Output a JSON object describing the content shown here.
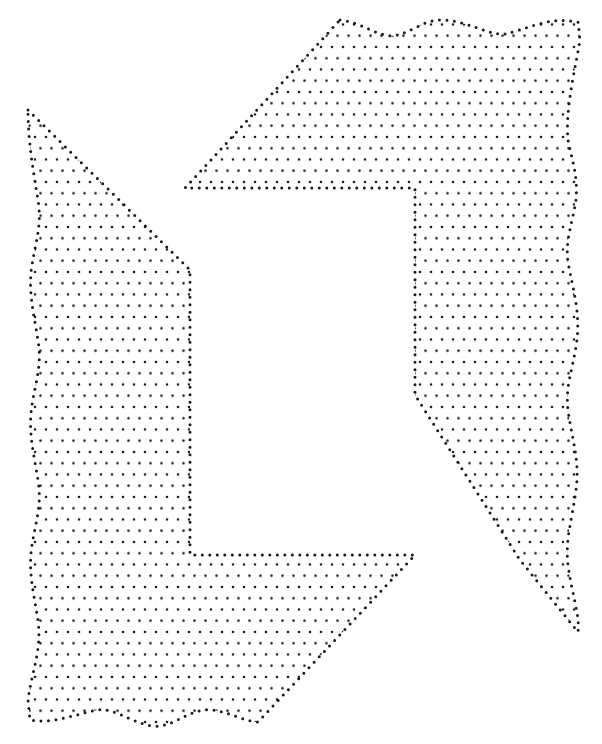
{
  "figure": {
    "dot_color": "#1a1a1a",
    "background": "#ffffff",
    "dot_spacing": 11,
    "dot_radius": 1.3,
    "outline_dot_radius": 1.5,
    "shapes": [
      {
        "name": "top-right-l-shape",
        "outline": "M340,20 C360,22 375,35 392,36 C410,34 425,18 445,20 C470,22 490,36 505,34 C525,30 548,16 578,22 L580,40 C575,70 565,110 568,140 C572,160 578,175 576,200 C572,225 565,240 568,262 C573,290 580,310 577,340 C573,370 565,385 568,410 C572,440 580,460 576,490 C572,520 565,540 568,565 C572,595 580,615 578,632 L520,560 L415,395 L415,188 L185,188 L340,20 Z"
      },
      {
        "name": "bottom-left-l-shape",
        "outline": "M28,110 L190,270 L190,555 L415,555 L258,722 C238,720 222,708 205,710 C185,712 172,728 152,726 C130,722 115,708 98,710 C75,714 55,724 30,720 L28,700 C32,670 42,650 38,620 C33,590 28,570 32,545 C36,520 42,505 38,480 C33,450 28,430 32,405 C36,380 42,365 38,340 C33,310 28,290 32,265 C36,240 42,225 38,200 C33,170 28,140 28,110 Z"
      }
    ]
  }
}
